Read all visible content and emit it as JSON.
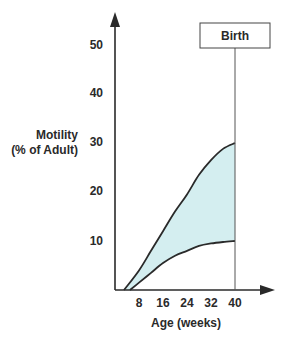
{
  "chart_data": {
    "type": "area",
    "title": "",
    "xlabel": "Age (weeks)",
    "ylabel_line1": "Motility",
    "ylabel_line2": "(% of Adult)",
    "x_ticks": [
      "8",
      "16",
      "24",
      "32",
      "40"
    ],
    "y_ticks": [
      "10",
      "20",
      "30",
      "40",
      "50"
    ],
    "xlim": [
      0,
      52
    ],
    "ylim": [
      0,
      55
    ],
    "grid": false,
    "annotation": {
      "label": "Birth",
      "x": 40
    },
    "series": [
      {
        "name": "upper bound",
        "x": [
          3,
          8,
          12,
          16,
          20,
          24,
          28,
          32,
          36,
          40
        ],
        "values": [
          0,
          4,
          8,
          12,
          16,
          19.5,
          23.5,
          26.5,
          28.8,
          30
        ]
      },
      {
        "name": "lower bound",
        "x": [
          5,
          8,
          12,
          16,
          20,
          24,
          28,
          32,
          36,
          40
        ],
        "values": [
          0,
          1.5,
          3.5,
          5.5,
          7,
          8,
          9,
          9.5,
          9.8,
          10
        ]
      }
    ],
    "fill_between": true,
    "colors": {
      "fill": "#d4eef0",
      "line": "#2a2a2a"
    }
  }
}
